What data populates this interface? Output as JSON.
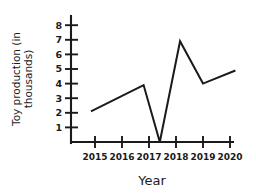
{
  "chart_data": {
    "type": "line",
    "title": "",
    "xlabel": "Year",
    "ylabel": "Toy production (in thousands)",
    "ylabel_line1": "Toy production (in",
    "ylabel_line2": "thousands)",
    "x_tick_labels": [
      "2015",
      "2016",
      "2017",
      "2018",
      "2019",
      "2020"
    ],
    "y_tick_labels": [
      "1",
      "2",
      "3",
      "4",
      "5",
      "6",
      "7",
      "8"
    ],
    "y_tick_values": [
      1,
      2,
      3,
      4,
      5,
      6,
      7,
      8
    ],
    "xlim": [
      2014.7,
      2020.5
    ],
    "ylim": [
      0,
      8.7
    ],
    "grid": false,
    "legend": null,
    "series": [
      {
        "name": "Toy production",
        "x": [
          2014.85,
          2016.8,
          2017.4,
          2018.15,
          2019.0,
          2020.2
        ],
        "values": [
          2.1,
          3.9,
          0.0,
          6.9,
          4.0,
          4.9
        ]
      }
    ],
    "line_color": "#1a1a1a",
    "background_color": "#ffffff"
  }
}
